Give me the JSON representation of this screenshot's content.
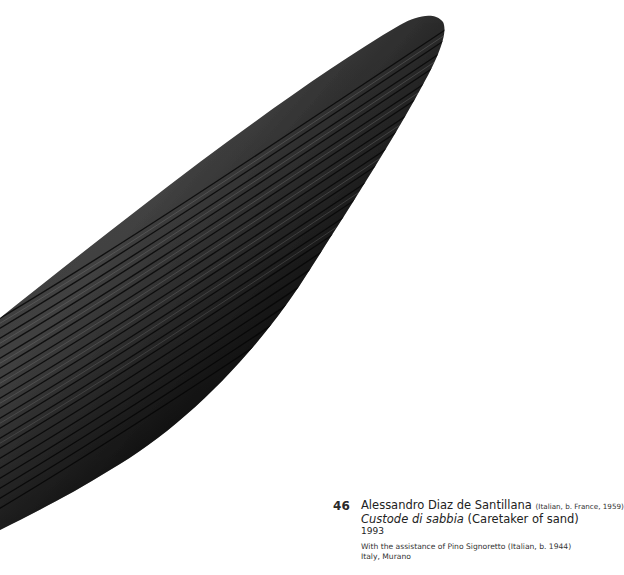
{
  "artwork": {
    "description": "Black glass elongated spindle-shaped sculpture with fine engraved parallel striations",
    "colors": {
      "body": "#1a1a1a",
      "highlight": "#5a5a5a",
      "background": "#ffffff"
    }
  },
  "caption": {
    "number": "46",
    "artist": "Alessandro Diaz de Santillana",
    "artist_meta": "(Italian, b. France, 1959)",
    "title_italic": "Custode di sabbia",
    "title_translation": "(Caretaker of sand)",
    "year": "1993",
    "assistance": "With the assistance of Pino Signoretto (Italian, b. 1944)",
    "place": "Italy, Murano"
  }
}
